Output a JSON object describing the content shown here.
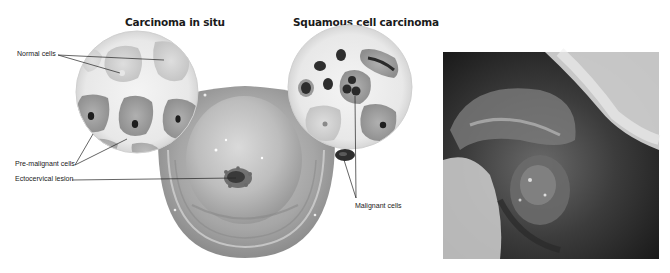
{
  "figure": {
    "left_panel": {
      "titles": {
        "carcinoma_in_situ": "Carcinoma in situ",
        "squamous_cell_carcinoma": "Squamous cell carcinoma"
      },
      "labels": {
        "normal_cells": "Normal cells",
        "pre_malignant_cells": "Pre-malignant cells",
        "ectocervical_lesion": "Ectocervical lesion",
        "malignant_cells": "Malignant cells"
      }
    },
    "right_panel": {
      "description": "Clinical photograph of ectocervical lesion"
    }
  },
  "colors": {
    "background": "#ffffff",
    "tissue_light": "#d4d4d4",
    "tissue_mid": "#a8a8a8",
    "tissue_dark": "#7a7a7a",
    "nucleus": "#2a2a2a",
    "leader_line": "#222222"
  }
}
